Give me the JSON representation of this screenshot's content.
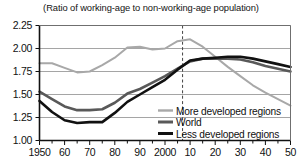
{
  "chart_data": {
    "type": "line",
    "title": "(Ratio of working-age to non-working-age population)",
    "xlabel": "",
    "ylabel": "",
    "xlim": [
      1950,
      2050
    ],
    "ylim": [
      1.0,
      2.25
    ],
    "grid": true,
    "legend_position": "inside-bottom-right",
    "y_ticks": [
      1.0,
      1.25,
      1.5,
      1.75,
      2.0,
      2.25
    ],
    "y_tick_labels": [
      "1.00",
      "1.25",
      "1.50",
      "1.75",
      "2.00",
      "2.25"
    ],
    "x_ticks": [
      1950,
      1960,
      1970,
      1980,
      1990,
      2000,
      2010,
      2020,
      2030,
      2040,
      2050
    ],
    "x_tick_labels": [
      "1950",
      "60",
      "70",
      "80",
      "90",
      "2000",
      "10",
      "20",
      "30",
      "40",
      "50"
    ],
    "x_minor_tick_step": 5,
    "annotations": [
      {
        "type": "vertical-dashed-line",
        "x": 2007,
        "label": ""
      }
    ],
    "x": [
      1950,
      1955,
      1960,
      1965,
      1970,
      1975,
      1980,
      1985,
      1990,
      1995,
      2000,
      2005,
      2010,
      2015,
      2020,
      2025,
      2030,
      2035,
      2040,
      2045,
      2050
    ],
    "series": [
      {
        "name": "More developed regions",
        "color": "#a8a8a8",
        "width": 2.0,
        "values": [
          1.84,
          1.84,
          1.79,
          1.74,
          1.75,
          1.82,
          1.9,
          2.01,
          2.02,
          1.99,
          2.0,
          2.08,
          2.1,
          2.02,
          1.91,
          1.8,
          1.7,
          1.6,
          1.52,
          1.45,
          1.38
        ]
      },
      {
        "name": "World",
        "color": "#595959",
        "width": 2.6,
        "values": [
          1.53,
          1.45,
          1.37,
          1.33,
          1.33,
          1.34,
          1.41,
          1.51,
          1.56,
          1.63,
          1.7,
          1.78,
          1.86,
          1.89,
          1.89,
          1.89,
          1.88,
          1.85,
          1.81,
          1.78,
          1.75
        ]
      },
      {
        "name": "Less developed regions",
        "color": "#111111",
        "width": 2.6,
        "values": [
          1.43,
          1.31,
          1.22,
          1.19,
          1.2,
          1.2,
          1.3,
          1.42,
          1.5,
          1.58,
          1.66,
          1.77,
          1.87,
          1.89,
          1.9,
          1.91,
          1.91,
          1.89,
          1.86,
          1.83,
          1.8
        ]
      }
    ]
  },
  "legend": {
    "items": [
      {
        "label": "More developed regions"
      },
      {
        "label": "World"
      },
      {
        "label": "Less developed regions"
      }
    ]
  }
}
